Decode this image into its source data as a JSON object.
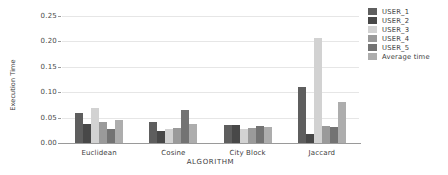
{
  "chart_data": {
    "type": "bar",
    "title": "",
    "xlabel": "ALGORITHM",
    "ylabel": "Execution Time",
    "categories": [
      "Euclidean",
      "Cosine",
      "City Block",
      "Jaccard"
    ],
    "ylim": [
      0.0,
      0.25
    ],
    "yticks": [
      0.0,
      0.05,
      0.1,
      0.15,
      0.2,
      0.25
    ],
    "ytick_labels": [
      "0.00",
      "0.05",
      "0.10",
      "0.15",
      "0.20",
      "0.25"
    ],
    "grid": true,
    "legend_position": "right",
    "series": [
      {
        "name": "USER_1",
        "color": "#5e5e5e",
        "values": [
          0.059,
          0.041,
          0.035,
          0.11
        ]
      },
      {
        "name": "USER_2",
        "color": "#484848",
        "values": [
          0.037,
          0.024,
          0.036,
          0.017
        ]
      },
      {
        "name": "USER_3",
        "color": "#d2d2d2",
        "values": [
          0.068,
          0.028,
          0.028,
          0.207
        ]
      },
      {
        "name": "USER_4",
        "color": "#9a9a9a",
        "values": [
          0.041,
          0.029,
          0.029,
          0.034
        ]
      },
      {
        "name": "USER_5",
        "color": "#737373",
        "values": [
          0.027,
          0.065,
          0.033,
          0.031
        ]
      },
      {
        "name": "Average time",
        "color": "#adadad",
        "values": [
          0.046,
          0.037,
          0.032,
          0.08
        ]
      }
    ]
  }
}
